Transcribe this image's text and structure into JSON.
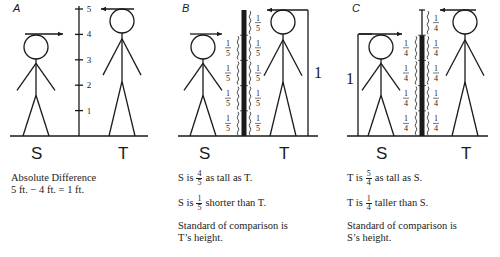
{
  "panels": [
    {
      "id": "A",
      "label": "A",
      "figures": {
        "left": "S",
        "right": "T"
      },
      "scale": {
        "ticks": [
          "1",
          "2",
          "3",
          "4",
          "5"
        ]
      },
      "caption": {
        "line1": "Absolute Difference",
        "line2": "5 ft. − 4 ft. = 1 ft."
      }
    },
    {
      "id": "B",
      "label": "B",
      "figures": {
        "left": "S",
        "right": "T"
      },
      "fraction_unit": {
        "num": "1",
        "den": "5"
      },
      "bracket_label": "1",
      "caption": {
        "line1_prefix": "S is",
        "line1_frac": {
          "num": "4",
          "den": "5"
        },
        "line1_suffix": "as tall as T.",
        "line2_prefix": "S is",
        "line2_frac": {
          "num": "1",
          "den": "5"
        },
        "line2_suffix": "shorter than T.",
        "line3": "Standard of comparison is",
        "line4": "T’s height."
      }
    },
    {
      "id": "C",
      "label": "C",
      "figures": {
        "left": "S",
        "right": "T"
      },
      "fraction_unit": {
        "num": "1",
        "den": "4"
      },
      "bracket_label": "1",
      "caption": {
        "line1_prefix": "T is",
        "line1_frac": {
          "num": "5",
          "den": "4"
        },
        "line1_suffix": "as tall as S.",
        "line2_prefix": "T is",
        "line2_frac": {
          "num": "1",
          "den": "4"
        },
        "line2_suffix": "taller than S.",
        "line3": "Standard of comparison is",
        "line4": "S’s height."
      }
    }
  ],
  "colors": {
    "ink": "#1a1a1a",
    "background": "#ffffff"
  }
}
